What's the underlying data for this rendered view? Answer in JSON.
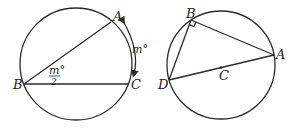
{
  "figures": [
    {
      "name": "inscribed-angle-figure",
      "circle": {
        "cx": 76,
        "cy": 64,
        "r": 56
      },
      "points": {
        "A": {
          "label": "A",
          "x": 113,
          "y": 21
        },
        "B": {
          "label": "B",
          "x": 21,
          "y": 85
        },
        "C": {
          "label": "C",
          "x": 131,
          "y": 85
        }
      },
      "angle_label": {
        "numerator": "m°",
        "denominator": "2"
      },
      "arc_label": "m°"
    },
    {
      "name": "right-angle-diameter-figure",
      "circle": {
        "cx": 221,
        "cy": 65,
        "r": 54
      },
      "points": {
        "A": {
          "label": "A",
          "x": 274,
          "y": 55
        },
        "B": {
          "label": "B",
          "x": 191,
          "y": 20
        },
        "C": {
          "label": "C",
          "x": 221,
          "y": 67
        },
        "D": {
          "label": "D",
          "x": 168,
          "y": 80
        }
      }
    }
  ]
}
